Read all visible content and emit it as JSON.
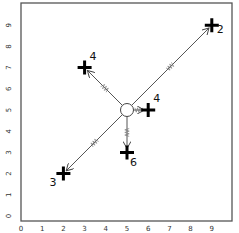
{
  "chart_data": {
    "type": "scatter",
    "title": "",
    "xlabel": "",
    "ylabel": "",
    "xlim": [
      0,
      9.5
    ],
    "ylim": [
      0,
      9.8
    ],
    "grid": false,
    "x_ticks": [
      "0",
      "1",
      "2",
      "3",
      "4",
      "5",
      "6",
      "7",
      "8",
      "9"
    ],
    "y_ticks": [
      "0",
      "1",
      "2",
      "3",
      "4",
      "5",
      "6",
      "7",
      "8",
      "9"
    ],
    "center": {
      "x": 5,
      "y": 5,
      "marker": "circle"
    },
    "points": [
      {
        "x": 9,
        "y": 9,
        "label": "2",
        "marker": "cross"
      },
      {
        "x": 3,
        "y": 7,
        "label": "4",
        "marker": "cross"
      },
      {
        "x": 6,
        "y": 5,
        "label": "4",
        "marker": "cross"
      },
      {
        "x": 5,
        "y": 3,
        "label": "6",
        "marker": "cross"
      },
      {
        "x": 2,
        "y": 2,
        "label": "3",
        "marker": "cross"
      }
    ],
    "arrows": [
      {
        "from": [
          5,
          5
        ],
        "to": [
          9,
          9
        ],
        "style": "line-with-spring"
      },
      {
        "from": [
          5,
          5
        ],
        "to": [
          3,
          7
        ],
        "style": "line-with-spring"
      },
      {
        "from": [
          5,
          5
        ],
        "to": [
          6,
          5
        ],
        "style": "spring"
      },
      {
        "from": [
          5,
          5
        ],
        "to": [
          5,
          3
        ],
        "style": "spring"
      },
      {
        "from": [
          5,
          5
        ],
        "to": [
          2,
          2
        ],
        "style": "line-with-spring"
      }
    ]
  }
}
